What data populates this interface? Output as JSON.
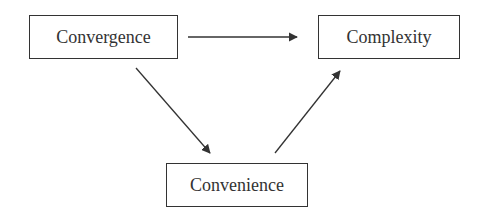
{
  "nodes": {
    "convergence": {
      "label": "Convergence"
    },
    "complexity": {
      "label": "Complexity"
    },
    "convenience": {
      "label": "Convenience"
    }
  },
  "edges": [
    {
      "from": "Convergence",
      "to": "Complexity"
    },
    {
      "from": "Convergence",
      "to": "Convenience"
    },
    {
      "from": "Convenience",
      "to": "Complexity"
    }
  ],
  "colors": {
    "stroke": "#333333"
  }
}
